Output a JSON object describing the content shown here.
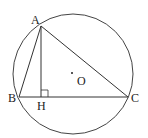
{
  "diagram": {
    "title": "",
    "circle": {
      "cx": 73,
      "cy": 74,
      "r": 60,
      "stroke": "#444444"
    },
    "points": {
      "A": {
        "x": 41,
        "y": 26,
        "label": "A",
        "lx": 31,
        "ly": 24
      },
      "B": {
        "x": 19,
        "y": 97,
        "label": "B",
        "lx": 8,
        "ly": 102
      },
      "C": {
        "x": 128,
        "y": 97,
        "label": "C",
        "lx": 131,
        "ly": 102
      },
      "H": {
        "x": 41,
        "y": 97,
        "label": "H",
        "lx": 37,
        "ly": 110
      },
      "O": {
        "x": 72,
        "y": 73,
        "label": "O",
        "lx": 77,
        "ly": 85
      }
    },
    "segments": [
      "AB",
      "AC",
      "BC",
      "AH"
    ],
    "right_angle_at": "H",
    "line_color": "#333333"
  }
}
